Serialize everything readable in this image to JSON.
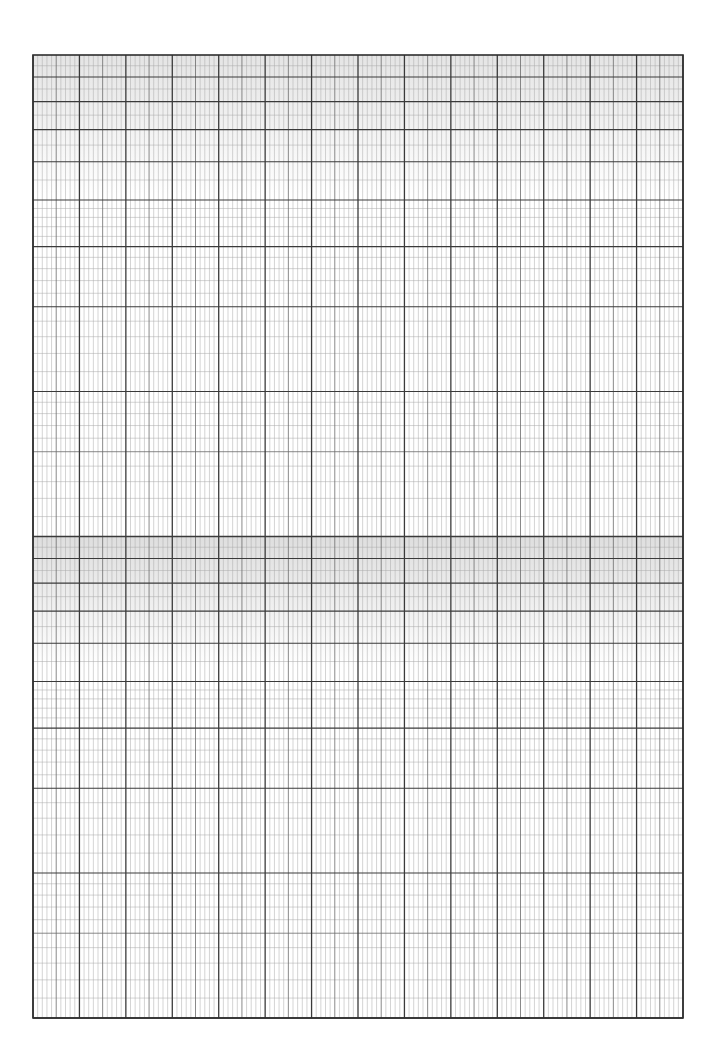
{
  "sheet": {
    "type": "semi-log graph paper",
    "page_width": 713,
    "page_height": 1043,
    "grid": {
      "left": 33,
      "top": 55,
      "right": 683,
      "bottom": 1018,
      "x_major_divisions": 14,
      "x_minor_per_major": 10,
      "x_mid_per_major": 5,
      "y_log_cycles": 2,
      "y_log_minor_per_unit": 10
    },
    "colors": {
      "background": "#ffffff",
      "line_major": "#3a3a3a",
      "line_mid": "#6b6b6b",
      "line_minor": "#a8a8a8",
      "border": "#2e2e2e",
      "band_shade": "#d9d9d9"
    }
  }
}
